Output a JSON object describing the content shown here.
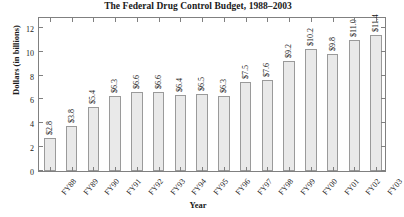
{
  "chart_data": {
    "type": "bar",
    "title": "The Federal Drug Control Budget, 1988–2003",
    "xlabel": "Year",
    "ylabel": "Dollars (in billions)",
    "categories": [
      "FY88",
      "FY89",
      "FY90",
      "FY91",
      "FY92",
      "FY93",
      "FY94",
      "FY95",
      "FY96",
      "FY97",
      "FY98",
      "FY99",
      "FY00",
      "FY01",
      "FY02",
      "FY03"
    ],
    "values": [
      2.8,
      3.8,
      5.4,
      6.3,
      6.6,
      6.6,
      6.4,
      6.5,
      6.3,
      7.5,
      7.6,
      9.2,
      10.2,
      9.8,
      11.0,
      11.4
    ],
    "value_labels": [
      "$2.8",
      "$3.8",
      "$5.4",
      "$6.3",
      "$6.6",
      "$6.6",
      "$6.4",
      "$6.5",
      "$6.3",
      "$7.5",
      "$7.6",
      "$9.2",
      "$10.2",
      "$9.8",
      "$11.0",
      "$11.4"
    ],
    "yticks": [
      0,
      2,
      4,
      6,
      8,
      10,
      12
    ],
    "ytick_labels": [
      "0",
      "2",
      "4",
      "6",
      "8",
      "10",
      "12"
    ],
    "ylim": [
      0,
      13
    ],
    "grid": false,
    "legend": null,
    "bar_color": "#e9e9e9",
    "bar_border_color": "#9a9a9a",
    "axis_color": "#808080"
  }
}
